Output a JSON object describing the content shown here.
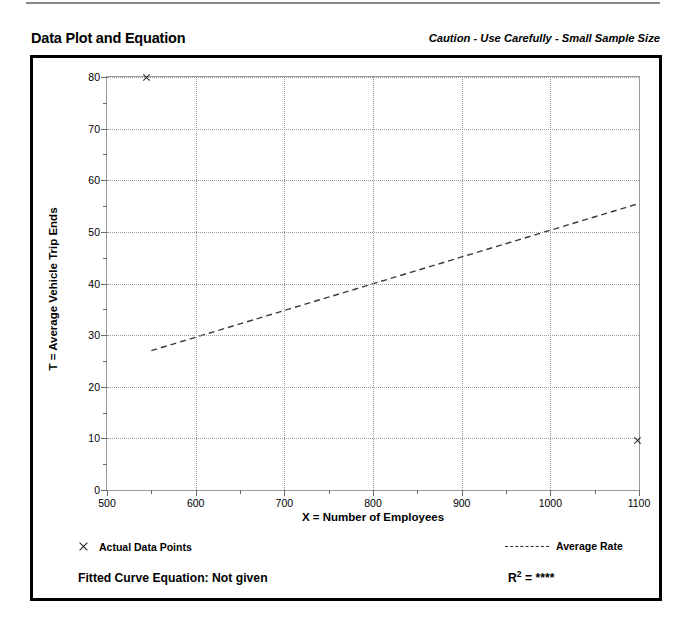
{
  "header": {
    "title": "Data Plot and Equation",
    "caution": "Caution - Use Carefully - Small Sample Size"
  },
  "footer": {
    "legend_points_label": "Actual Data Points",
    "legend_rate_label": "Average Rate",
    "fitted_equation_label": "Fitted Curve Equation:  Not given",
    "r_squared_label": "R",
    "r_squared_exponent": "2",
    "r_squared_value": "= ****"
  },
  "icons": {
    "data_point_marker": "x-cross-marker",
    "average_rate_marker": "dashed-line-marker"
  },
  "chart_data": {
    "type": "scatter",
    "title": "Data Plot and Equation",
    "xlabel": "X = Number of Employees",
    "ylabel": "T = Average Vehicle Trip Ends",
    "xlim": [
      500,
      1100
    ],
    "ylim": [
      0,
      80
    ],
    "x_major_ticks": [
      500,
      600,
      700,
      800,
      900,
      1000,
      1100
    ],
    "x_minor_ticks": [
      550,
      650,
      750,
      850,
      950,
      1050
    ],
    "y_major_ticks": [
      0,
      10,
      20,
      30,
      40,
      50,
      60,
      70,
      80
    ],
    "y_minor_ticks": [
      5,
      15,
      25,
      35,
      45,
      55,
      65,
      75
    ],
    "x_tick_labels": [
      "500",
      "600",
      "700",
      "800",
      "900",
      "1000",
      "1100"
    ],
    "y_tick_labels": [
      "0",
      "10",
      "20",
      "30",
      "40",
      "50",
      "60",
      "70",
      "80"
    ],
    "grid": true,
    "grid_style": "dotted",
    "series": [
      {
        "name": "Actual Data Points",
        "type": "scatter",
        "marker": "x",
        "points": [
          {
            "x": 545,
            "y": 80.0
          },
          {
            "x": 1098,
            "y": 9.5
          }
        ]
      },
      {
        "name": "Average Rate",
        "type": "line",
        "style": "dashed",
        "points": [
          {
            "x": 550,
            "y": 27.0
          },
          {
            "x": 1100,
            "y": 55.5
          }
        ]
      }
    ],
    "legend_position": "below-plot",
    "annotations": [
      "Caution - Use Carefully - Small Sample Size",
      "Fitted Curve Equation:  Not given",
      "R2 = ****"
    ]
  }
}
